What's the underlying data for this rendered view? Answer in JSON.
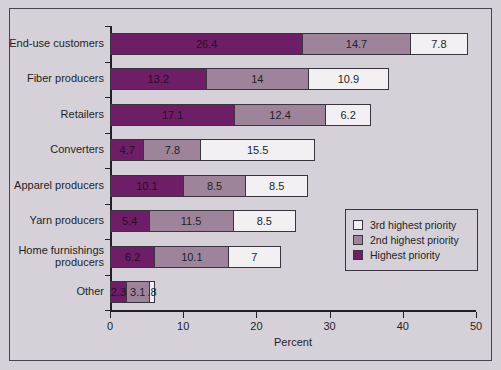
{
  "chart_data": {
    "type": "bar",
    "orientation": "horizontal",
    "stacked": true,
    "title": "",
    "xlabel": "Percent",
    "ylabel": "",
    "xlim": [
      0,
      50
    ],
    "xticks": [
      0,
      10,
      20,
      30,
      40,
      50
    ],
    "xticklabels": [
      "0",
      "10",
      "20",
      "30",
      "40",
      "50"
    ],
    "grid": false,
    "legend_position": "inside-right",
    "categories": [
      "End-use customers",
      "Fiber producers",
      "Retailers",
      "Converters",
      "Apparel producers",
      "Yarn producers",
      "Home furnishings\nproducers",
      "Other"
    ],
    "series": [
      {
        "name": "Highest priority",
        "color": "#6d1e66",
        "values": [
          26.4,
          13.2,
          17.1,
          4.7,
          10.1,
          5.4,
          6.2,
          2.3
        ],
        "labels": [
          "26.4",
          "13.2",
          "17.1",
          "4.7",
          "10.1",
          "5.4",
          "6.2",
          "2.3"
        ]
      },
      {
        "name": "2nd highest priority",
        "color": "#9e849b",
        "values": [
          14.7,
          14,
          12.4,
          7.8,
          8.5,
          11.5,
          10.1,
          3.1
        ],
        "labels": [
          "14.7",
          "14",
          "12.4",
          "7.8",
          "8.5",
          "11.5",
          "10.1",
          "3.1"
        ]
      },
      {
        "name": "3rd highest priority",
        "color": "#f2f0f3",
        "values": [
          7.8,
          10.9,
          6.2,
          15.5,
          8.5,
          8.5,
          7,
          0.8
        ],
        "labels": [
          "7.8",
          "10.9",
          "6.2",
          "15.5",
          "8.5",
          "8.5",
          "7",
          ".8"
        ]
      }
    ]
  },
  "legend": {
    "items": [
      {
        "label": "3rd highest priority",
        "color": "#f2f0f3"
      },
      {
        "label": "2nd highest priority",
        "color": "#9e849b"
      },
      {
        "label": "Highest priority",
        "color": "#6d1e66"
      }
    ]
  },
  "colors": {
    "background": "#d6d1d9",
    "axis": "#231f26",
    "border": "#4a4452",
    "segment_border": "#3a3340"
  }
}
